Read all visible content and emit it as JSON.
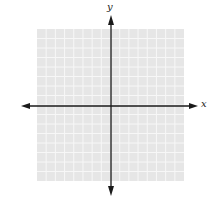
{
  "chart_data": {
    "type": "scatter",
    "title": "",
    "xlabel": "x",
    "ylabel": "y",
    "xlim": [
      -8,
      8
    ],
    "ylim": [
      -8,
      8
    ],
    "grid": true,
    "grid_columns": 16,
    "grid_rows": 16,
    "series": [],
    "legend": null
  },
  "colors": {
    "grid_fill": "#e6e6e6",
    "grid_line": "#f7f7f7",
    "axis": "#1a1a1a"
  },
  "axes": {
    "x_label": "x",
    "y_label": "y"
  }
}
